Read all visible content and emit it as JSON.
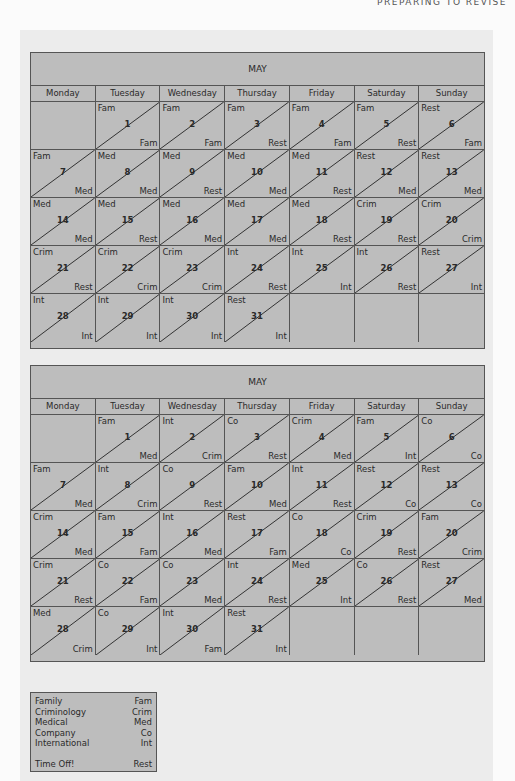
{
  "running_head": "PREPARING TO REVISE",
  "days": [
    "Monday",
    "Tuesday",
    "Wednesday",
    "Thursday",
    "Friday",
    "Saturday",
    "Sunday"
  ],
  "calendars": [
    {
      "title": "MAY",
      "cells": [
        {
          "empty": true
        },
        {
          "day": "1",
          "top": "Fam",
          "bottom": "Fam"
        },
        {
          "day": "2",
          "top": "Fam",
          "bottom": "Fam"
        },
        {
          "day": "3",
          "top": "Fam",
          "bottom": "Rest"
        },
        {
          "day": "4",
          "top": "Fam",
          "bottom": "Fam"
        },
        {
          "day": "5",
          "top": "Fam",
          "bottom": "Rest"
        },
        {
          "day": "6",
          "top": "Rest",
          "bottom": "Fam"
        },
        {
          "day": "7",
          "top": "Fam",
          "bottom": "Med"
        },
        {
          "day": "8",
          "top": "Med",
          "bottom": "Med"
        },
        {
          "day": "9",
          "top": "Med",
          "bottom": "Rest"
        },
        {
          "day": "10",
          "top": "Med",
          "bottom": "Med"
        },
        {
          "day": "11",
          "top": "Med",
          "bottom": "Rest"
        },
        {
          "day": "12",
          "top": "Rest",
          "bottom": "Med"
        },
        {
          "day": "13",
          "top": "Rest",
          "bottom": "Med"
        },
        {
          "day": "14",
          "top": "Med",
          "bottom": "Med"
        },
        {
          "day": "15",
          "top": "Med",
          "bottom": "Rest"
        },
        {
          "day": "16",
          "top": "Med",
          "bottom": "Med"
        },
        {
          "day": "17",
          "top": "Med",
          "bottom": "Med"
        },
        {
          "day": "18",
          "top": "Med",
          "bottom": "Rest"
        },
        {
          "day": "19",
          "top": "Crim",
          "bottom": "Rest"
        },
        {
          "day": "20",
          "top": "Crim",
          "bottom": "Crim"
        },
        {
          "day": "21",
          "top": "Crim",
          "bottom": "Rest"
        },
        {
          "day": "22",
          "top": "Crim",
          "bottom": "Crim"
        },
        {
          "day": "23",
          "top": "Crim",
          "bottom": "Crim"
        },
        {
          "day": "24",
          "top": "Int",
          "bottom": "Rest"
        },
        {
          "day": "25",
          "top": "Int",
          "bottom": "Int"
        },
        {
          "day": "26",
          "top": "Int",
          "bottom": "Rest"
        },
        {
          "day": "27",
          "top": "Rest",
          "bottom": "Int"
        },
        {
          "day": "28",
          "top": "Int",
          "bottom": "Int"
        },
        {
          "day": "29",
          "top": "Int",
          "bottom": "Int"
        },
        {
          "day": "30",
          "top": "Int",
          "bottom": "Int"
        },
        {
          "day": "31",
          "top": "Rest",
          "bottom": "Int"
        },
        {
          "empty": true
        },
        {
          "empty": true
        },
        {
          "empty": true
        }
      ]
    },
    {
      "title": "MAY",
      "cells": [
        {
          "empty": true
        },
        {
          "day": "1",
          "top": "Fam",
          "bottom": "Med"
        },
        {
          "day": "2",
          "top": "Int",
          "bottom": "Crim"
        },
        {
          "day": "3",
          "top": "Co",
          "bottom": "Rest"
        },
        {
          "day": "4",
          "top": "Crim",
          "bottom": "Med"
        },
        {
          "day": "5",
          "top": "Fam",
          "bottom": "Int"
        },
        {
          "day": "6",
          "top": "Co",
          "bottom": "Co"
        },
        {
          "day": "7",
          "top": "Fam",
          "bottom": "Med"
        },
        {
          "day": "8",
          "top": "Int",
          "bottom": "Crim"
        },
        {
          "day": "9",
          "top": "Co",
          "bottom": "Rest"
        },
        {
          "day": "10",
          "top": "Fam",
          "bottom": "Med"
        },
        {
          "day": "11",
          "top": "Int",
          "bottom": "Rest"
        },
        {
          "day": "12",
          "top": "Rest",
          "bottom": "Co"
        },
        {
          "day": "13",
          "top": "Rest",
          "bottom": "Co"
        },
        {
          "day": "14",
          "top": "Crim",
          "bottom": "Med"
        },
        {
          "day": "15",
          "top": "Fam",
          "bottom": "Fam"
        },
        {
          "day": "16",
          "top": "Int",
          "bottom": "Med"
        },
        {
          "day": "17",
          "top": "Rest",
          "bottom": "Fam"
        },
        {
          "day": "18",
          "top": "Co",
          "bottom": "Co"
        },
        {
          "day": "19",
          "top": "Crim",
          "bottom": "Rest"
        },
        {
          "day": "20",
          "top": "Fam",
          "bottom": "Crim"
        },
        {
          "day": "21",
          "top": "Crim",
          "bottom": "Rest"
        },
        {
          "day": "22",
          "top": "Co",
          "bottom": "Fam"
        },
        {
          "day": "23",
          "top": "Co",
          "bottom": "Med"
        },
        {
          "day": "24",
          "top": "Int",
          "bottom": "Rest"
        },
        {
          "day": "25",
          "top": "Med",
          "bottom": "Int"
        },
        {
          "day": "26",
          "top": "Co",
          "bottom": "Rest"
        },
        {
          "day": "27",
          "top": "Rest",
          "bottom": "Med"
        },
        {
          "day": "28",
          "top": "Med",
          "bottom": "Crim"
        },
        {
          "day": "29",
          "top": "Co",
          "bottom": "Int"
        },
        {
          "day": "30",
          "top": "Int",
          "bottom": "Fam"
        },
        {
          "day": "31",
          "top": "Rest",
          "bottom": "Int"
        },
        {
          "empty": true
        },
        {
          "empty": true
        },
        {
          "empty": true
        }
      ]
    }
  ],
  "legend": [
    {
      "label": "Family",
      "abbr": "Fam"
    },
    {
      "label": "Criminology",
      "abbr": "Crim"
    },
    {
      "label": "Medical",
      "abbr": "Med"
    },
    {
      "label": "Company",
      "abbr": "Co"
    },
    {
      "label": "International",
      "abbr": "Int"
    },
    {
      "gap": true
    },
    {
      "label": "Time Off!",
      "abbr": "Rest"
    }
  ],
  "colors": {
    "cell_bg": "#bdbdbd",
    "border": "#555555",
    "panel_bg": "#ececec",
    "page_bg": "#fbfbfb"
  }
}
